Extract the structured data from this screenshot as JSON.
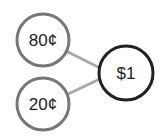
{
  "diagram": {
    "type": "number-bond",
    "whole": {
      "label": "$1",
      "cx": 126,
      "cy": 73,
      "r": 27,
      "stroke": "#222222"
    },
    "parts": [
      {
        "label": "80¢",
        "cx": 43,
        "cy": 40,
        "r": 26,
        "stroke": "#777777"
      },
      {
        "label": "20¢",
        "cx": 43,
        "cy": 104,
        "r": 26,
        "stroke": "#777777"
      }
    ],
    "connector_color": "#a8a8a8"
  }
}
